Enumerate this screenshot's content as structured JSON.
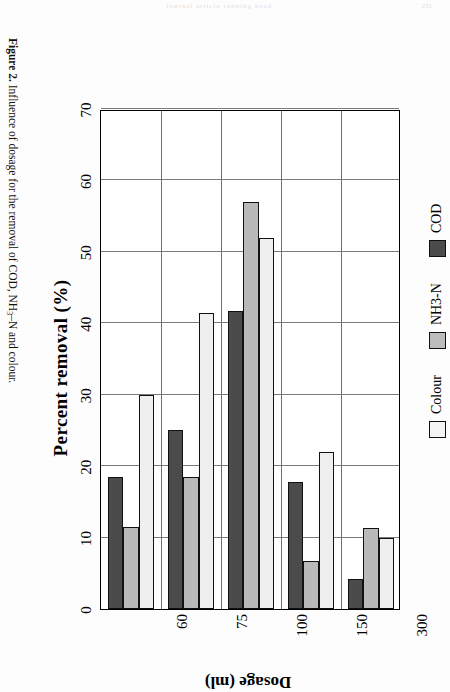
{
  "page": {
    "header_text": "Journal article running head",
    "page_number": "231"
  },
  "caption": {
    "label": "Figure 2.",
    "text_before_sub": " Influence of dosage for the removal of COD, NH",
    "subscript": "3",
    "text_after_sub": "–N and colour."
  },
  "legend": {
    "position": "bottom",
    "items": [
      {
        "name": "colour-legend-item",
        "label": "Colour",
        "color": "#f3f3f3"
      },
      {
        "name": "nh3n-legend-item",
        "label": "NH3-N",
        "color": "#bcbcbc"
      },
      {
        "name": "cod-legend-item",
        "label": "COD",
        "color": "#4b4b4b"
      }
    ]
  },
  "chart_data": {
    "type": "bar",
    "orientation": "horizontal",
    "title": "",
    "xlabel": "Percent removal (%)",
    "ylabel": "Dosage (ml)",
    "xlim": [
      0,
      70
    ],
    "xticks": [
      0,
      10,
      20,
      30,
      40,
      50,
      60,
      70
    ],
    "xticklabels": [
      "0",
      "10",
      "20",
      "30",
      "40",
      "50",
      "60",
      "70"
    ],
    "categories": [
      "60",
      "75",
      "100",
      "150",
      "300"
    ],
    "grid": "vertical",
    "legend_position": "bottom",
    "series": [
      {
        "name": "Colour",
        "color": "#efefef",
        "values": [
          30.0,
          41.5,
          52.0,
          22.0,
          10.0
        ]
      },
      {
        "name": "NH3-N",
        "color": "#b9b9b9",
        "values": [
          11.5,
          18.5,
          57.0,
          6.7,
          11.3
        ]
      },
      {
        "name": "COD",
        "color": "#4b4b4b",
        "values": [
          18.5,
          25.0,
          41.7,
          17.8,
          4.2
        ]
      }
    ]
  }
}
